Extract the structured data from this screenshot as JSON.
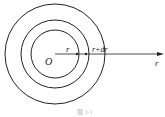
{
  "diagram": {
    "origin_label": "O",
    "inner_radius_label": "r",
    "outer_radius_label": "r+dr",
    "axis_label": "r",
    "caption": "图 1-1",
    "stroke_color": "#222222"
  }
}
